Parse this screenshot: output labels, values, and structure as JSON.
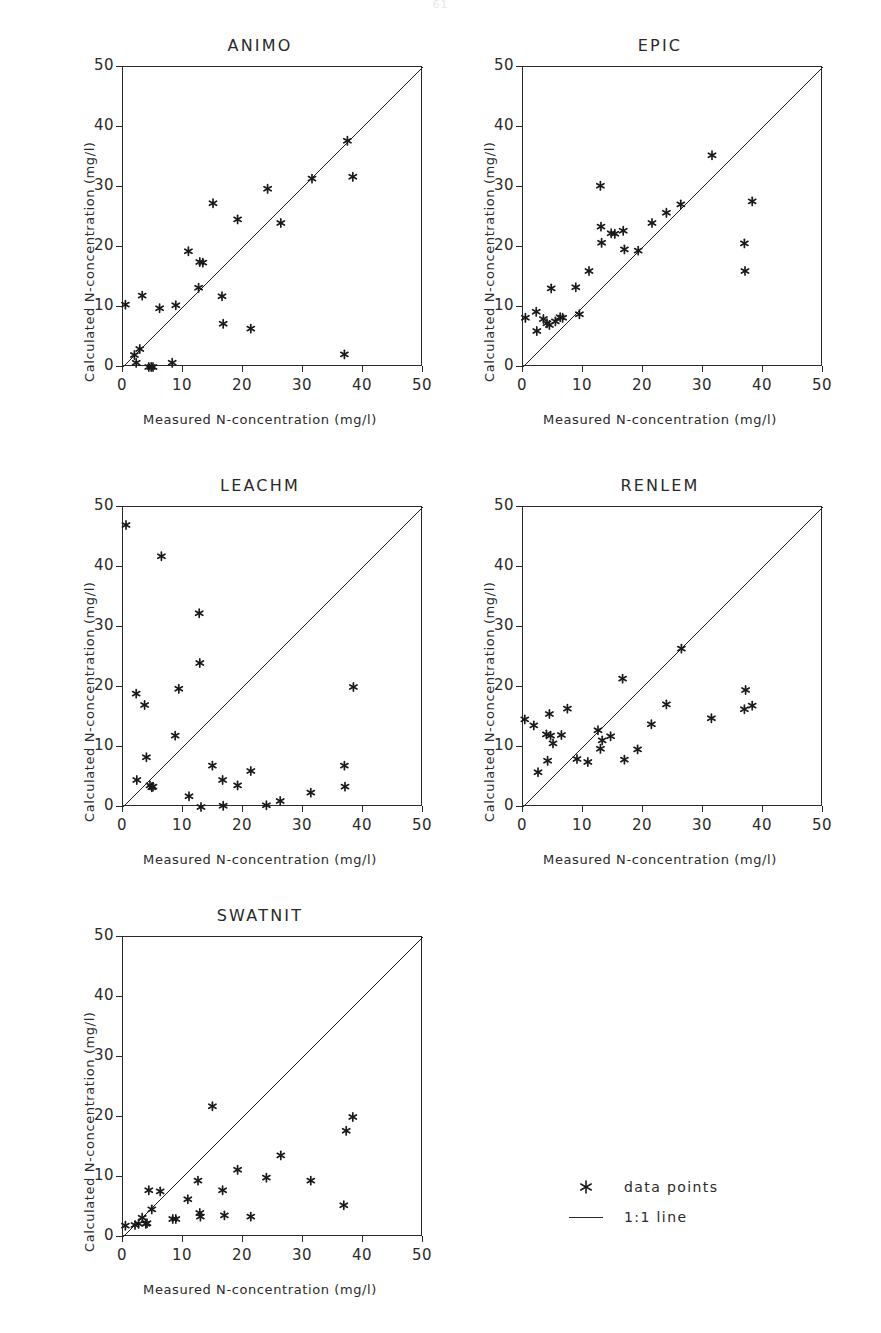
{
  "page_number": "61",
  "axes": {
    "xlabel": "Measured N-concentration (mg/l)",
    "ylabel": "Calculated N-concentration (mg/l)",
    "xticks": [
      "0",
      "10",
      "20",
      "30",
      "40",
      "50"
    ],
    "yticks": [
      "0",
      "10",
      "20",
      "30",
      "40",
      "50"
    ],
    "xlim": [
      0,
      50
    ],
    "ylim": [
      0,
      50
    ]
  },
  "legend": {
    "items": [
      {
        "label": "data points",
        "marker": "asterisk-marker"
      },
      {
        "label": "1:1 line",
        "marker": "line-marker"
      }
    ]
  },
  "chart_data": [
    {
      "type": "scatter",
      "title": "ANIMO",
      "xlabel": "Measured N-concentration (mg/l)",
      "ylabel": "Calculated N-concentration (mg/l)",
      "xlim": [
        0,
        50
      ],
      "ylim": [
        0,
        50
      ],
      "grid": false,
      "reference_line": {
        "name": "1:1 line",
        "from": [
          0,
          0
        ],
        "to": [
          50,
          50
        ]
      },
      "points": [
        [
          0.4,
          10.4
        ],
        [
          1.9,
          2.0
        ],
        [
          2.2,
          0.7
        ],
        [
          2.8,
          3.0
        ],
        [
          3.2,
          11.9
        ],
        [
          4.3,
          0.0
        ],
        [
          4.7,
          0.0
        ],
        [
          5.0,
          0.0
        ],
        [
          6.1,
          9.8
        ],
        [
          8.2,
          0.7
        ],
        [
          8.8,
          10.3
        ],
        [
          10.9,
          19.3
        ],
        [
          12.6,
          13.2
        ],
        [
          12.8,
          17.5
        ],
        [
          13.3,
          17.4
        ],
        [
          15.0,
          27.3
        ],
        [
          16.5,
          11.8
        ],
        [
          16.7,
          7.2
        ],
        [
          19.1,
          24.6
        ],
        [
          21.3,
          6.4
        ],
        [
          24.1,
          29.7
        ],
        [
          26.3,
          24.0
        ],
        [
          31.5,
          31.4
        ],
        [
          36.9,
          2.1
        ],
        [
          37.4,
          37.7
        ],
        [
          38.3,
          31.7
        ]
      ]
    },
    {
      "type": "scatter",
      "title": "EPIC",
      "xlabel": "Measured N-concentration (mg/l)",
      "ylabel": "Calculated N-concentration (mg/l)",
      "xlim": [
        0,
        50
      ],
      "ylim": [
        0,
        50
      ],
      "grid": false,
      "reference_line": {
        "name": "1:1 line",
        "from": [
          0,
          0
        ],
        "to": [
          50,
          50
        ]
      },
      "points": [
        [
          0.4,
          8.2
        ],
        [
          2.2,
          9.2
        ],
        [
          2.3,
          6.0
        ],
        [
          3.4,
          8.0
        ],
        [
          4.0,
          7.3
        ],
        [
          4.4,
          7.0
        ],
        [
          4.7,
          13.1
        ],
        [
          5.4,
          7.6
        ],
        [
          6.2,
          8.3
        ],
        [
          6.6,
          8.2
        ],
        [
          8.8,
          13.3
        ],
        [
          9.4,
          8.8
        ],
        [
          11.0,
          16.0
        ],
        [
          12.9,
          30.2
        ],
        [
          13.0,
          23.4
        ],
        [
          13.1,
          20.7
        ],
        [
          14.7,
          22.3
        ],
        [
          15.3,
          22.2
        ],
        [
          16.7,
          22.7
        ],
        [
          16.9,
          19.6
        ],
        [
          19.2,
          19.4
        ],
        [
          21.5,
          24.0
        ],
        [
          23.9,
          25.7
        ],
        [
          26.3,
          27.1
        ],
        [
          31.5,
          35.3
        ],
        [
          36.9,
          20.6
        ],
        [
          37.0,
          16.0
        ],
        [
          38.2,
          27.6
        ]
      ]
    },
    {
      "type": "scatter",
      "title": "LEACHM",
      "xlabel": "Measured N-concentration (mg/l)",
      "ylabel": "Calculated N-concentration (mg/l)",
      "xlim": [
        0,
        50
      ],
      "ylim": [
        0,
        50
      ],
      "grid": false,
      "reference_line": {
        "name": "1:1 line",
        "from": [
          0,
          0
        ],
        "to": [
          50,
          50
        ]
      },
      "points": [
        [
          0.5,
          47.0
        ],
        [
          2.2,
          18.9
        ],
        [
          2.3,
          4.5
        ],
        [
          3.6,
          17.0
        ],
        [
          3.9,
          8.3
        ],
        [
          4.5,
          3.6
        ],
        [
          4.8,
          3.3
        ],
        [
          5.0,
          3.4
        ],
        [
          6.4,
          41.8
        ],
        [
          8.7,
          11.9
        ],
        [
          9.3,
          19.7
        ],
        [
          11.0,
          1.8
        ],
        [
          12.7,
          32.3
        ],
        [
          12.8,
          24.0
        ],
        [
          13.0,
          0.0
        ],
        [
          14.9,
          6.9
        ],
        [
          16.6,
          4.5
        ],
        [
          16.7,
          0.2
        ],
        [
          19.1,
          3.6
        ],
        [
          21.3,
          6.0
        ],
        [
          23.9,
          0.3
        ],
        [
          26.2,
          1.0
        ],
        [
          31.3,
          2.4
        ],
        [
          36.9,
          6.9
        ],
        [
          37.0,
          3.4
        ],
        [
          38.4,
          20.0
        ]
      ]
    },
    {
      "type": "scatter",
      "title": "RENLEM",
      "xlabel": "Measured N-concentration (mg/l)",
      "ylabel": "Calculated N-concentration (mg/l)",
      "xlim": [
        0,
        50
      ],
      "ylim": [
        0,
        50
      ],
      "grid": false,
      "reference_line": {
        "name": "1:1 line",
        "from": [
          0,
          0
        ],
        "to": [
          50,
          50
        ]
      },
      "points": [
        [
          0.3,
          14.6
        ],
        [
          1.8,
          13.6
        ],
        [
          2.5,
          5.8
        ],
        [
          3.9,
          12.1
        ],
        [
          4.1,
          7.7
        ],
        [
          4.4,
          15.5
        ],
        [
          4.6,
          11.9
        ],
        [
          5.0,
          10.6
        ],
        [
          6.4,
          12.0
        ],
        [
          7.4,
          16.4
        ],
        [
          9.0,
          8.0
        ],
        [
          10.8,
          7.5
        ],
        [
          12.5,
          12.8
        ],
        [
          12.9,
          9.7
        ],
        [
          13.2,
          11.1
        ],
        [
          14.6,
          11.8
        ],
        [
          16.6,
          21.4
        ],
        [
          16.9,
          7.9
        ],
        [
          19.1,
          9.6
        ],
        [
          21.4,
          13.8
        ],
        [
          23.9,
          17.1
        ],
        [
          26.4,
          26.4
        ],
        [
          31.4,
          14.8
        ],
        [
          36.9,
          16.3
        ],
        [
          37.1,
          19.5
        ],
        [
          38.2,
          16.9
        ]
      ]
    },
    {
      "type": "scatter",
      "title": "SWATNIT",
      "xlabel": "Measured N-concentration (mg/l)",
      "ylabel": "Calculated N-concentration (mg/l)",
      "xlim": [
        0,
        50
      ],
      "ylim": [
        0,
        50
      ],
      "grid": false,
      "reference_line": {
        "name": "1:1 line",
        "from": [
          0,
          0
        ],
        "to": [
          50,
          50
        ]
      },
      "points": [
        [
          0.4,
          1.9
        ],
        [
          2.0,
          2.0
        ],
        [
          2.6,
          2.2
        ],
        [
          3.2,
          3.2
        ],
        [
          3.8,
          2.2
        ],
        [
          4.0,
          2.3
        ],
        [
          4.3,
          7.8
        ],
        [
          4.8,
          4.6
        ],
        [
          6.2,
          7.6
        ],
        [
          8.3,
          3.0
        ],
        [
          8.8,
          3.0
        ],
        [
          10.8,
          6.3
        ],
        [
          12.5,
          9.4
        ],
        [
          12.8,
          4.0
        ],
        [
          12.9,
          3.4
        ],
        [
          14.9,
          21.8
        ],
        [
          16.6,
          7.8
        ],
        [
          16.9,
          3.6
        ],
        [
          19.1,
          11.2
        ],
        [
          21.3,
          3.4
        ],
        [
          23.9,
          9.9
        ],
        [
          26.3,
          13.6
        ],
        [
          31.3,
          9.4
        ],
        [
          36.8,
          5.3
        ],
        [
          37.2,
          17.7
        ],
        [
          38.3,
          20.0
        ]
      ]
    }
  ]
}
